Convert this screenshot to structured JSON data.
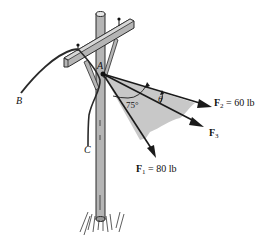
{
  "figure": {
    "point_A": "A",
    "point_B": "B",
    "point_C": "C",
    "angle_75": "75°",
    "angle_theta": "θ",
    "forces": [
      {
        "symbol": "F",
        "sub": "1",
        "text": " = 80 lb"
      },
      {
        "symbol": "F",
        "sub": "2",
        "text": " = 60 lb"
      },
      {
        "symbol": "F",
        "sub": "3",
        "text": ""
      }
    ],
    "colors": {
      "pole": "#b5b5b5",
      "outline": "#2a2a2a",
      "shade": "#c8c8c8",
      "arrow": "#1a1a1a"
    }
  }
}
